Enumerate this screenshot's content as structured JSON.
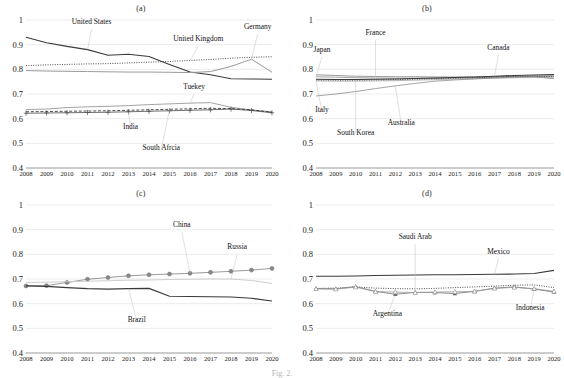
{
  "figure": {
    "caption": "Fig. 2.",
    "panels_layout": "2x2"
  },
  "axis": {
    "y_ticks": [
      "1",
      "0.9",
      "0.8",
      "0.7",
      "0.6",
      "0.5",
      "0.4"
    ],
    "x_ticks": [
      "2008",
      "2009",
      "2010",
      "2011",
      "2012",
      "2013",
      "2014",
      "2015",
      "2016",
      "2017",
      "2018",
      "2019",
      "2020"
    ],
    "ylim": [
      0.4,
      1.0
    ],
    "xlim": [
      2008,
      2020
    ]
  },
  "panels": [
    {
      "key": "a",
      "title": "(a)"
    },
    {
      "key": "b",
      "title": "(b)"
    },
    {
      "key": "c",
      "title": "(c)"
    },
    {
      "key": "d",
      "title": "(d)"
    }
  ],
  "chart_data": [
    {
      "type": "line",
      "title": "(a)",
      "xlabel": "",
      "ylabel": "",
      "ylim": [
        0.4,
        1.0
      ],
      "grid": true,
      "legend": "annotations",
      "x": [
        2008,
        2009,
        2010,
        2011,
        2012,
        2013,
        2014,
        2015,
        2016,
        2017,
        2018,
        2019,
        2020
      ],
      "series": [
        {
          "name": "United States",
          "style": "solid-dark",
          "values": [
            0.93,
            0.908,
            0.893,
            0.88,
            0.857,
            0.861,
            0.852,
            0.82,
            0.789,
            0.778,
            0.762,
            0.761,
            0.76
          ]
        },
        {
          "name": "United Kingdom",
          "style": "dotted",
          "values": [
            0.815,
            0.818,
            0.82,
            0.822,
            0.823,
            0.826,
            0.829,
            0.832,
            0.836,
            0.84,
            0.845,
            0.849,
            0.851
          ]
        },
        {
          "name": "Germany",
          "style": "solid-gray",
          "values": [
            0.795,
            0.793,
            0.792,
            0.791,
            0.79,
            0.789,
            0.789,
            0.788,
            0.787,
            0.791,
            0.812,
            0.841,
            0.788
          ]
        },
        {
          "name": "Tuekey",
          "style": "solid-thin",
          "values": [
            0.637,
            0.639,
            0.645,
            0.648,
            0.65,
            0.653,
            0.657,
            0.66,
            0.663,
            0.665,
            0.646,
            0.635,
            0.628
          ]
        },
        {
          "name": "India",
          "style": "plus-marker",
          "values": [
            0.622,
            0.623,
            0.624,
            0.625,
            0.626,
            0.628,
            0.63,
            0.632,
            0.634,
            0.636,
            0.639,
            0.633,
            0.624
          ]
        },
        {
          "name": "South Afrcia",
          "style": "dashed",
          "values": [
            0.628,
            0.629,
            0.63,
            0.631,
            0.632,
            0.634,
            0.636,
            0.638,
            0.64,
            0.642,
            0.641,
            0.636,
            0.626
          ]
        }
      ],
      "annotations": [
        {
          "label": "United States",
          "x": 2011.2,
          "y": 0.975
        },
        {
          "label": "United Kingdom",
          "x": 2016.4,
          "y": 0.905
        },
        {
          "label": "Germany",
          "x": 2019.3,
          "y": 0.955
        },
        {
          "label": "Tuekey",
          "x": 2016.2,
          "y": 0.712
        },
        {
          "label": "India",
          "x": 2013.1,
          "y": 0.548
        },
        {
          "label": "South Afrcia",
          "x": 2014.6,
          "y": 0.463
        }
      ]
    },
    {
      "type": "line",
      "title": "(b)",
      "xlabel": "",
      "ylabel": "",
      "ylim": [
        0.4,
        1.0
      ],
      "grid": true,
      "legend": "annotations",
      "x": [
        2008,
        2009,
        2010,
        2011,
        2012,
        2013,
        2014,
        2015,
        2016,
        2017,
        2018,
        2019,
        2020
      ],
      "series": [
        {
          "name": "France",
          "style": "solid-gray",
          "values": [
            0.778,
            0.775,
            0.772,
            0.771,
            0.77,
            0.77,
            0.769,
            0.769,
            0.769,
            0.77,
            0.771,
            0.772,
            0.773
          ]
        },
        {
          "name": "Japan",
          "style": "solid-thin",
          "values": [
            0.77,
            0.768,
            0.766,
            0.765,
            0.764,
            0.764,
            0.764,
            0.765,
            0.766,
            0.768,
            0.77,
            0.772,
            0.774
          ]
        },
        {
          "name": "Canada",
          "style": "solid-dark",
          "values": [
            0.76,
            0.759,
            0.759,
            0.76,
            0.761,
            0.763,
            0.765,
            0.767,
            0.769,
            0.772,
            0.775,
            0.777,
            0.779
          ]
        },
        {
          "name": "Italy",
          "style": "solid-gray2",
          "values": [
            0.753,
            0.752,
            0.752,
            0.753,
            0.754,
            0.756,
            0.758,
            0.76,
            0.762,
            0.764,
            0.766,
            0.767,
            0.766
          ]
        },
        {
          "name": "South Korea",
          "style": "dotted",
          "values": [
            0.757,
            0.756,
            0.756,
            0.757,
            0.758,
            0.76,
            0.762,
            0.764,
            0.766,
            0.768,
            0.77,
            0.772,
            0.77
          ]
        },
        {
          "name": "Australia",
          "style": "solid-thin2",
          "values": [
            0.692,
            0.7,
            0.71,
            0.722,
            0.733,
            0.743,
            0.752,
            0.757,
            0.761,
            0.765,
            0.768,
            0.77,
            0.762
          ]
        }
      ],
      "annotations": [
        {
          "label": "France",
          "x": 2011.0,
          "y": 0.93
        },
        {
          "label": "Japan",
          "x": 2008.3,
          "y": 0.862
        },
        {
          "label": "Canada",
          "x": 2017.2,
          "y": 0.872
        },
        {
          "label": "Italy",
          "x": 2008.3,
          "y": 0.617
        },
        {
          "label": "South Korea",
          "x": 2010.0,
          "y": 0.527
        },
        {
          "label": "Australia",
          "x": 2012.3,
          "y": 0.565
        }
      ]
    },
    {
      "type": "line",
      "title": "(c)",
      "xlabel": "",
      "ylabel": "",
      "ylim": [
        0.4,
        1.0
      ],
      "grid": true,
      "legend": "annotations",
      "x": [
        2008,
        2009,
        2010,
        2011,
        2012,
        2013,
        2014,
        2015,
        2016,
        2017,
        2018,
        2019,
        2020
      ],
      "series": [
        {
          "name": "China",
          "style": "circle-marker",
          "values": [
            0.672,
            0.673,
            0.686,
            0.699,
            0.706,
            0.713,
            0.717,
            0.72,
            0.723,
            0.727,
            0.731,
            0.736,
            0.743
          ]
        },
        {
          "name": "Brazil",
          "style": "solid-dark",
          "values": [
            0.672,
            0.67,
            0.665,
            0.661,
            0.659,
            0.661,
            0.662,
            0.63,
            0.629,
            0.628,
            0.627,
            0.622,
            0.611
          ]
        },
        {
          "name": "Russia",
          "style": "solid-faint",
          "values": [
            0.686,
            0.687,
            0.689,
            0.691,
            0.693,
            0.695,
            0.696,
            0.698,
            0.699,
            0.7,
            0.7,
            0.694,
            0.682
          ]
        }
      ],
      "annotations": [
        {
          "label": "China",
          "x": 2015.6,
          "y": 0.903
        },
        {
          "label": "Russia",
          "x": 2018.3,
          "y": 0.812
        },
        {
          "label": "Brazil",
          "x": 2013.4,
          "y": 0.518
        }
      ]
    },
    {
      "type": "line",
      "title": "(d)",
      "xlabel": "",
      "ylabel": "",
      "ylim": [
        0.4,
        1.0
      ],
      "grid": true,
      "legend": "annotations",
      "x": [
        2008,
        2009,
        2010,
        2011,
        2012,
        2013,
        2014,
        2015,
        2016,
        2017,
        2018,
        2019,
        2020
      ],
      "series": [
        {
          "name": "Saudi Arab",
          "style": "dotted",
          "values": [
            0.662,
            0.663,
            0.668,
            0.663,
            0.661,
            0.66,
            0.662,
            0.665,
            0.668,
            0.671,
            0.675,
            0.676,
            0.665
          ]
        },
        {
          "name": "Mexico",
          "style": "solid-dark",
          "values": [
            0.711,
            0.711,
            0.712,
            0.714,
            0.715,
            0.716,
            0.717,
            0.717,
            0.718,
            0.719,
            0.72,
            0.722,
            0.735
          ]
        },
        {
          "name": "Argentina",
          "style": "triangle-marker",
          "values": [
            0.661,
            0.66,
            0.669,
            0.65,
            0.638,
            0.646,
            0.645,
            0.641,
            0.65,
            0.663,
            0.668,
            0.659,
            0.647
          ]
        },
        {
          "name": "Indonesia",
          "style": "triangle-marker2",
          "values": [
            0.66,
            0.659,
            0.667,
            0.649,
            0.647,
            0.645,
            0.647,
            0.648,
            0.65,
            0.662,
            0.666,
            0.661,
            0.65
          ]
        }
      ],
      "annotations": [
        {
          "label": "Saudi Arab",
          "x": 2013.0,
          "y": 0.853
        },
        {
          "label": "Mexico",
          "x": 2017.2,
          "y": 0.795
        },
        {
          "label": "Argentina",
          "x": 2011.6,
          "y": 0.543
        },
        {
          "label": "Indonesia",
          "x": 2018.8,
          "y": 0.566
        }
      ]
    }
  ]
}
